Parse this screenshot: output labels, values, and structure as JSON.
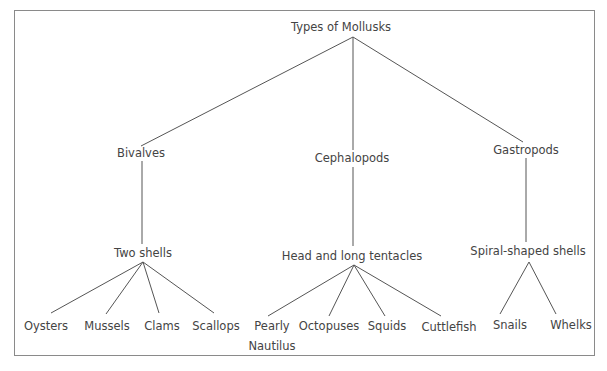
{
  "title": "Types of Mollusks",
  "colors": {
    "line": "#555555",
    "text": "#444444",
    "border": "#8a8a8a",
    "background": "#ffffff"
  },
  "nodes": {
    "root": {
      "label": "Types of Mollusks",
      "x": 341,
      "y": 27
    },
    "bivalves": {
      "label": "Bivalves",
      "x": 141,
      "y": 153
    },
    "cephalopods": {
      "label": "Cephalopods",
      "x": 352,
      "y": 158
    },
    "gastropods": {
      "label": "Gastropods",
      "x": 526,
      "y": 150
    },
    "two_shells": {
      "label": "Two shells",
      "x": 143,
      "y": 253
    },
    "head_tentacles": {
      "label": "Head and long tentacles",
      "x": 352,
      "y": 256
    },
    "spiral_shells": {
      "label": "Spiral-shaped shells",
      "x": 528,
      "y": 251
    },
    "oysters": {
      "label": "Oysters",
      "x": 46,
      "y": 326
    },
    "mussels": {
      "label": "Mussels",
      "x": 107,
      "y": 326
    },
    "clams": {
      "label": "Clams",
      "x": 162,
      "y": 326
    },
    "scallops": {
      "label": "Scallops",
      "x": 216,
      "y": 326
    },
    "pearly_nautilus": {
      "label": "Pearly",
      "label2": "Nautilus",
      "x": 272,
      "y": 336
    },
    "octopuses": {
      "label": "Octopuses",
      "x": 329,
      "y": 326
    },
    "squids": {
      "label": "Squids",
      "x": 387,
      "y": 326
    },
    "cuttlefish": {
      "label": "Cuttlefish",
      "x": 449,
      "y": 327
    },
    "snails": {
      "label": "Snails",
      "x": 510,
      "y": 325
    },
    "whelks": {
      "label": "Whelks",
      "x": 571,
      "y": 325
    }
  },
  "edges": [
    {
      "from": "root",
      "to": "bivalves",
      "x1": 353,
      "y1": 37,
      "x2": 141,
      "y2": 146
    },
    {
      "from": "root",
      "to": "cephalopods",
      "x1": 353,
      "y1": 37,
      "x2": 353,
      "y2": 150
    },
    {
      "from": "root",
      "to": "gastropods",
      "x1": 353,
      "y1": 37,
      "x2": 523,
      "y2": 142
    },
    {
      "from": "bivalves",
      "to": "two_shells",
      "x1": 142,
      "y1": 161,
      "x2": 142,
      "y2": 244
    },
    {
      "from": "cephalopods",
      "to": "head_tentacles",
      "x1": 353,
      "y1": 167,
      "x2": 353,
      "y2": 246
    },
    {
      "from": "gastropods",
      "to": "spiral_shells",
      "x1": 526,
      "y1": 158,
      "x2": 526,
      "y2": 242
    },
    {
      "from": "two_shells",
      "to": "oysters",
      "x1": 143,
      "y1": 262,
      "x2": 51,
      "y2": 313
    },
    {
      "from": "two_shells",
      "to": "mussels",
      "x1": 143,
      "y1": 262,
      "x2": 106,
      "y2": 314
    },
    {
      "from": "two_shells",
      "to": "clams",
      "x1": 143,
      "y1": 262,
      "x2": 159,
      "y2": 313
    },
    {
      "from": "two_shells",
      "to": "scallops",
      "x1": 143,
      "y1": 262,
      "x2": 214,
      "y2": 313
    },
    {
      "from": "head_tentacles",
      "to": "pearly_nautilus",
      "x1": 354,
      "y1": 265,
      "x2": 268,
      "y2": 316
    },
    {
      "from": "head_tentacles",
      "to": "octopuses",
      "x1": 354,
      "y1": 265,
      "x2": 329,
      "y2": 316
    },
    {
      "from": "head_tentacles",
      "to": "squids",
      "x1": 354,
      "y1": 265,
      "x2": 385,
      "y2": 316
    },
    {
      "from": "head_tentacles",
      "to": "cuttlefish",
      "x1": 354,
      "y1": 265,
      "x2": 441,
      "y2": 316
    },
    {
      "from": "spiral_shells",
      "to": "snails",
      "x1": 529,
      "y1": 262,
      "x2": 500,
      "y2": 314
    },
    {
      "from": "spiral_shells",
      "to": "whelks",
      "x1": 529,
      "y1": 262,
      "x2": 556,
      "y2": 314
    }
  ]
}
